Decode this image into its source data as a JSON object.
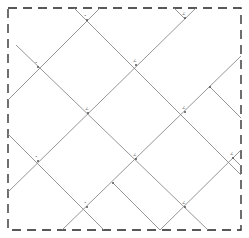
{
  "diagram": {
    "type": "diagonal-lattice",
    "width": 249,
    "height": 238,
    "border": {
      "x": 8,
      "y": 8,
      "w": 233,
      "h": 222,
      "stroke": "#222222",
      "dash": "9,6"
    },
    "line_color": "#8a8a8a",
    "dark_line_color": "#555555",
    "segments": [
      {
        "id": "l1",
        "x1": 100,
        "y1": 8,
        "x2": 8,
        "y2": 100
      },
      {
        "id": "l2",
        "x1": 74,
        "y1": 8,
        "x2": 241,
        "y2": 175
      },
      {
        "id": "l3",
        "x1": 196,
        "y1": 8,
        "x2": 8,
        "y2": 192
      },
      {
        "id": "l4",
        "x1": 16,
        "y1": 45,
        "x2": 208,
        "y2": 230
      },
      {
        "id": "l5",
        "x1": 8,
        "y1": 134,
        "x2": 104,
        "y2": 230
      },
      {
        "id": "l6",
        "x1": 62,
        "y1": 230,
        "x2": 241,
        "y2": 56
      },
      {
        "id": "l7",
        "x1": 160,
        "y1": 230,
        "x2": 241,
        "y2": 150
      },
      {
        "id": "l8",
        "x1": 210,
        "y1": 87,
        "x2": 241,
        "y2": 118
      },
      {
        "id": "l9",
        "x1": 113,
        "y1": 183,
        "x2": 160,
        "y2": 230
      },
      {
        "id": "l10",
        "x1": 174,
        "y1": 8,
        "x2": 185,
        "y2": 19
      },
      {
        "id": "l11",
        "x1": 233,
        "y1": 158,
        "x2": 241,
        "y2": 166
      }
    ],
    "nodes": [
      {
        "x": 87,
        "y": 20,
        "label": "•"
      },
      {
        "x": 185,
        "y": 18,
        "label": "∠"
      },
      {
        "x": 38,
        "y": 67,
        "label": "•"
      },
      {
        "x": 136,
        "y": 65,
        "label": "∠"
      },
      {
        "x": 88,
        "y": 113,
        "label": "∠"
      },
      {
        "x": 185,
        "y": 112,
        "label": "∠"
      },
      {
        "x": 38,
        "y": 161,
        "label": "•"
      },
      {
        "x": 87,
        "y": 207,
        "label": "•"
      },
      {
        "x": 136,
        "y": 159,
        "label": "∠"
      },
      {
        "x": 210,
        "y": 87,
        "label": ""
      },
      {
        "x": 233,
        "y": 158,
        "label": "∠"
      },
      {
        "x": 185,
        "y": 207,
        "label": "∠"
      },
      {
        "x": 113,
        "y": 183,
        "label": ""
      }
    ]
  }
}
